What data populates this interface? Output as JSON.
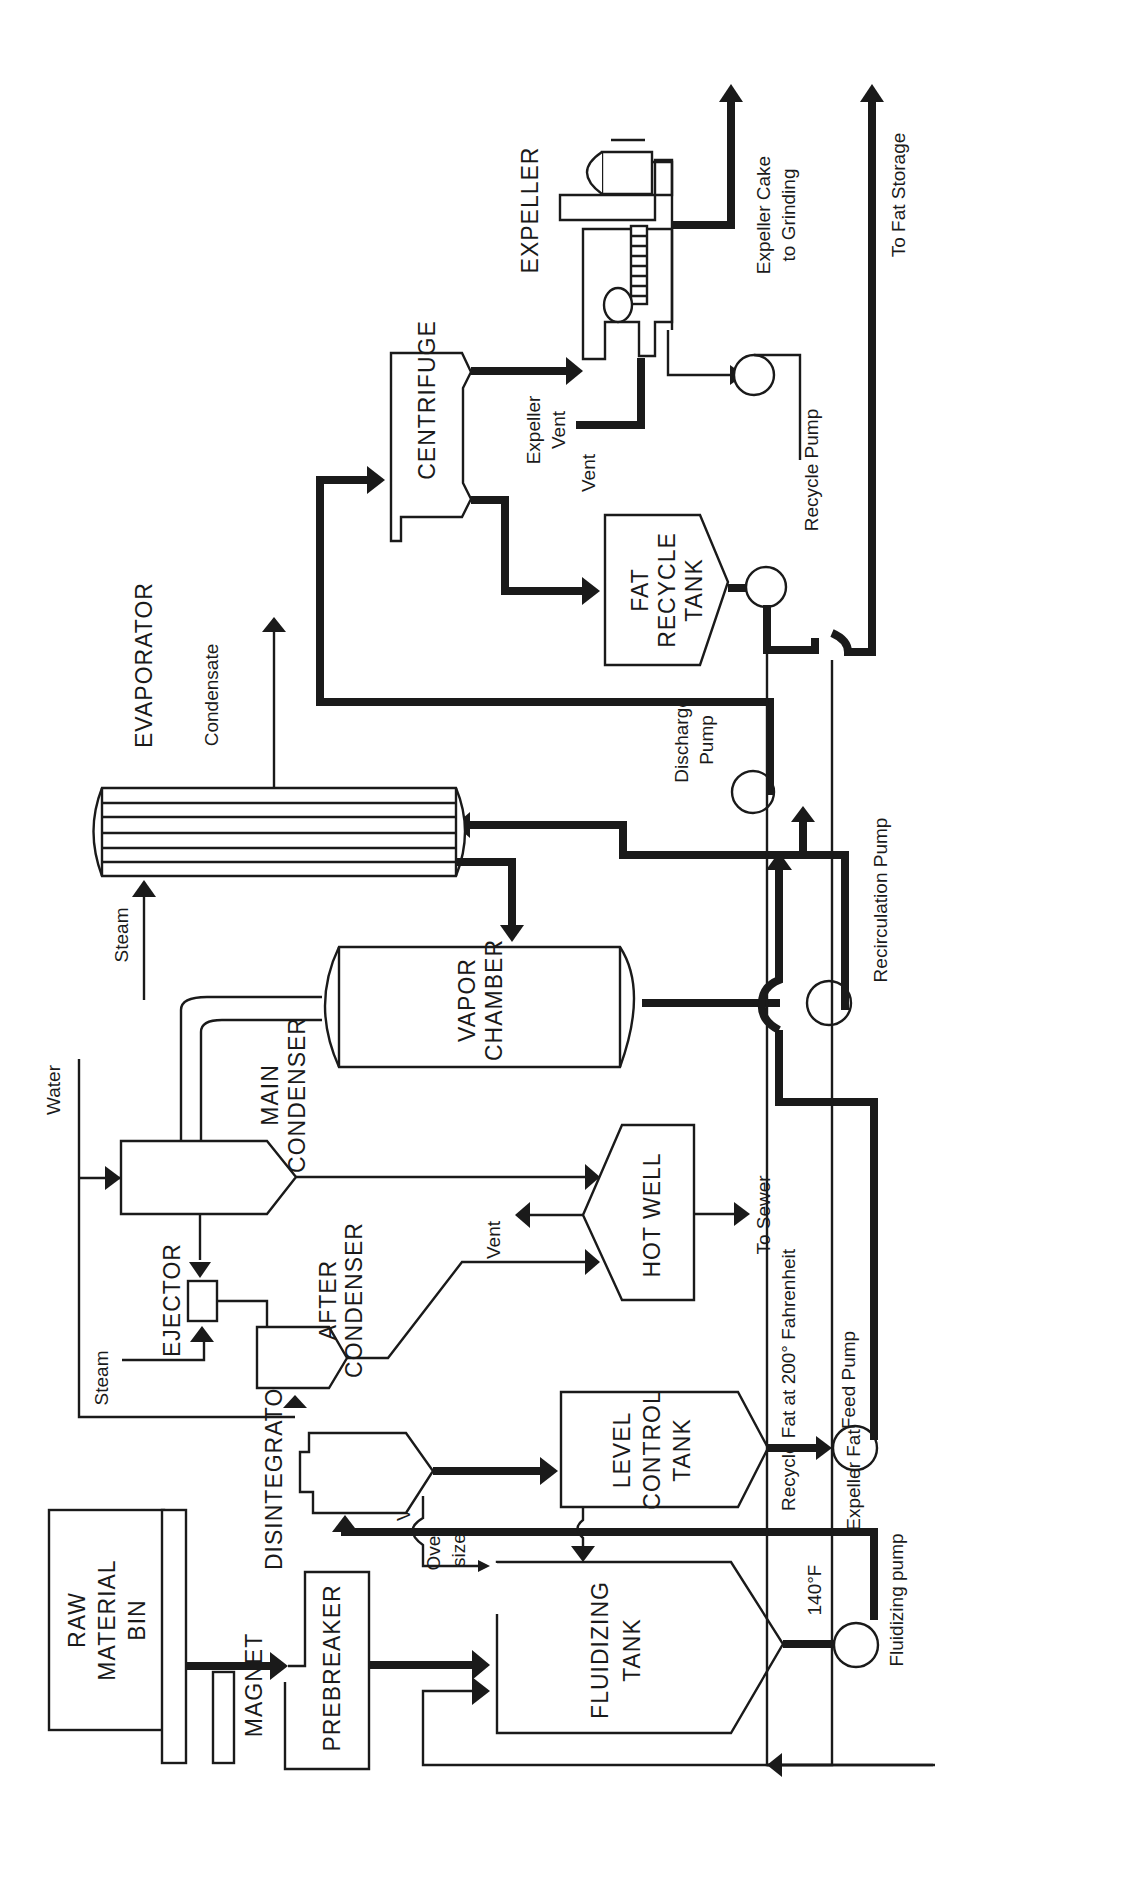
{
  "diagram": {
    "type": "process-flow-diagram",
    "orientation": "rotated-90-ccw",
    "colors": {
      "ink": "#1a1a1a",
      "background": "#ffffff"
    },
    "equipment": {
      "raw_material_bin": {
        "line1": "RAW",
        "line2": "MATERIAL",
        "line3": "BIN"
      },
      "magnet": "MAGNET",
      "prebreaker": "PREBREAKER",
      "disintegrator": "DISINTEGRATOR",
      "fluidizing_tank": {
        "line1": "FLUIDIZING",
        "line2": "TANK",
        "temperature": "140°F"
      },
      "fluidizing_pump": "Fluidizing pump",
      "level_control_tank": {
        "line1": "LEVEL",
        "line2": "CONTROL",
        "line3": "TANK"
      },
      "feed_pump": "Feed Pump",
      "ejector": "EJECTOR",
      "after_condenser": {
        "line1": "AFTER",
        "line2": "CONDENSER"
      },
      "main_condenser": {
        "line1": "MAIN",
        "line2": "CONDENSER"
      },
      "hot_well": "HOT WELL",
      "vapor_chamber": {
        "line1": "VAPOR",
        "line2": "CHAMBER"
      },
      "recirculation_pump": "Recirculation Pump",
      "evaporator": "EVAPORATOR",
      "discharge_pump": {
        "line1": "Discharge",
        "line2": "Pump"
      },
      "centrifuge": "CENTRIFUGE",
      "fat_recycle_tank": {
        "line1": "FAT",
        "line2": "RECYCLE",
        "line3": "TANK"
      },
      "recycle_pump": "Recycle Pump",
      "expeller": "EXPELLER"
    },
    "stream_labels": {
      "vent_prebreaker": "Vent",
      "oversize": {
        "line1": "Over",
        "line2": "size"
      },
      "water": "Water",
      "steam_ejector": "Steam",
      "steam_evaporator": "Steam",
      "condensate": "Condensate",
      "vent_hot_well": "Vent",
      "to_sewer": "To Sewer",
      "vent_fat_tank": "Vent",
      "expeller_vent": {
        "line1": "Expeller",
        "line2": "Vent"
      },
      "expeller_cake": {
        "line1": "Expeller Cake",
        "line2": "to Grinding"
      },
      "to_fat_storage": "To Fat Storage",
      "recycle_fat": "Recycle Fat at 200° Fahrenheit",
      "expeller_fat": "Expeller Fat"
    }
  }
}
